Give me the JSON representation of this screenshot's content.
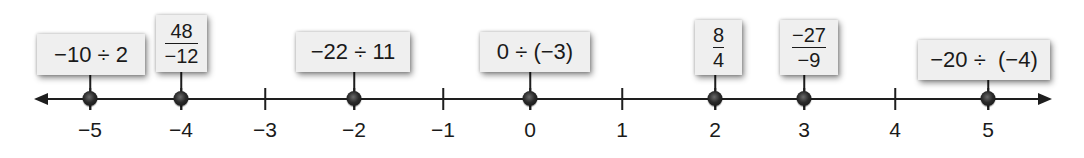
{
  "number_line": {
    "min": -5,
    "max": 5,
    "ticks": [
      {
        "value": -5,
        "label": "−5",
        "x": 90
      },
      {
        "value": -4,
        "label": "−4",
        "x": 181
      },
      {
        "value": -3,
        "label": "−3",
        "x": 265
      },
      {
        "value": -2,
        "label": "−2",
        "x": 354
      },
      {
        "value": -1,
        "label": "−1",
        "x": 443
      },
      {
        "value": 0,
        "label": "0",
        "x": 530
      },
      {
        "value": 1,
        "label": "1",
        "x": 622
      },
      {
        "value": 2,
        "label": "2",
        "x": 715
      },
      {
        "value": 3,
        "label": "3",
        "x": 804
      },
      {
        "value": 4,
        "label": "4",
        "x": 895
      },
      {
        "value": 5,
        "label": "5",
        "x": 988
      }
    ],
    "arrows": {
      "left": "arrow-left-icon",
      "right": "arrow-right-icon"
    }
  },
  "expressions": [
    {
      "type": "inline",
      "text": "−10 ÷ 2",
      "value": -5,
      "box": {
        "left": 37,
        "top": 34,
        "width": 108,
        "height": 41
      }
    },
    {
      "type": "fraction",
      "numerator": "48",
      "denominator": "−12",
      "value": -4,
      "box": {
        "left": 156,
        "top": 15,
        "width": 51,
        "height": 57
      }
    },
    {
      "type": "inline",
      "text": "−22 ÷ 11",
      "value": -2,
      "box": {
        "left": 296,
        "top": 32,
        "width": 114,
        "height": 40
      }
    },
    {
      "type": "inline",
      "text": "0 ÷ (−3)",
      "value": 0,
      "box": {
        "left": 480,
        "top": 32,
        "width": 110,
        "height": 40
      }
    },
    {
      "type": "fraction",
      "numerator": "8",
      "denominator": "4",
      "value": 2,
      "box": {
        "left": 695,
        "top": 20,
        "width": 47,
        "height": 55
      }
    },
    {
      "type": "fraction",
      "numerator": "−27",
      "denominator": "−9",
      "value": 3,
      "box": {
        "left": 780,
        "top": 20,
        "width": 58,
        "height": 55
      }
    },
    {
      "type": "inline",
      "text": "−20 ÷  (−4)",
      "value": 5,
      "box": {
        "left": 918,
        "top": 40,
        "width": 132,
        "height": 40
      }
    }
  ],
  "colors": {
    "line": "#1e1e1e",
    "box_fill": "#efefef",
    "text": "#1a1a1a",
    "dot": "#1a1a1a"
  }
}
